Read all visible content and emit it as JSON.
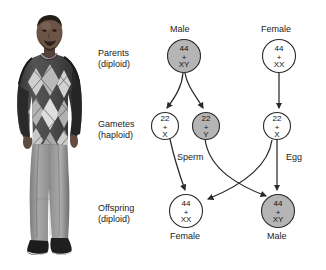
{
  "figure": {
    "type": "genetics-pedigree-diagram"
  },
  "photo": {
    "alt": "Photograph of a standing man wearing an argyle sweater and jeans",
    "name": "person-photograph"
  },
  "row_labels": [
    {
      "line1": "Parents",
      "line2": "(diploid)"
    },
    {
      "line1": "Gametes",
      "line2": "(haploid)"
    },
    {
      "line1": "Offspring",
      "line2": "(diploid)"
    }
  ],
  "headers": {
    "parent_male": "Male",
    "parent_female": "Female"
  },
  "captions": {
    "offspring_female": "Female",
    "offspring_male": "Male"
  },
  "arrow_labels": {
    "sperm": "Sperm",
    "egg": "Egg"
  },
  "nodes": {
    "parent_male": {
      "count": "44",
      "plus": "+",
      "chromosomes": "XY",
      "shaded": true
    },
    "parent_female": {
      "count": "44",
      "plus": "+",
      "chromosomes": "XX",
      "shaded": false
    },
    "gamete_x_sperm": {
      "count": "22",
      "plus": "+",
      "chromosomes": "X",
      "shaded": false
    },
    "gamete_y_sperm": {
      "count": "22",
      "plus": "+",
      "chromosomes": "Y",
      "shaded": true
    },
    "gamete_x_egg": {
      "count": "22",
      "plus": "+",
      "chromosomes": "X",
      "shaded": false
    },
    "offspring_female": {
      "count": "44",
      "plus": "+",
      "chromosomes": "XX",
      "shaded": false
    },
    "offspring_male": {
      "count": "44",
      "plus": "+",
      "chromosomes": "XY",
      "shaded": true
    }
  },
  "colors": {
    "shaded_fill": "#b5b5b5",
    "plain_fill": "#ffffff",
    "stroke": "#2b2b2b",
    "text": "#1a1a1a",
    "background": "#ffffff"
  }
}
